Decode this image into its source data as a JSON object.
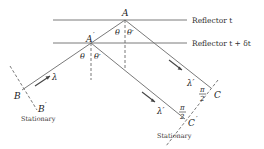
{
  "diagram": {
    "title": "",
    "reflectors": [
      {
        "label": "Reflector t",
        "y": 20
      },
      {
        "label": "Reflector t + δt",
        "y": 43
      }
    ],
    "points": {
      "A": {
        "label": "A",
        "x": 125,
        "y": 20
      },
      "A_prime": {
        "label": "A",
        "prime": "′",
        "x": 91,
        "y": 43
      },
      "B": {
        "label": "B",
        "x": 22,
        "y": 90
      },
      "B_prime": {
        "label": "B",
        "prime": "′"
      },
      "C": {
        "label": "C",
        "x": 211,
        "y": 88
      },
      "C_prime": {
        "label": "C",
        "prime": "′",
        "x": 185,
        "y": 119
      }
    },
    "angles": {
      "theta": "θ",
      "theta_prime": "θ′",
      "right_angle_num": "π",
      "right_angle_den": "2"
    },
    "wavelengths": {
      "incident": "λ",
      "reflected": "λ′"
    },
    "stationary_labels": [
      "Stationary",
      "Stationary"
    ]
  }
}
